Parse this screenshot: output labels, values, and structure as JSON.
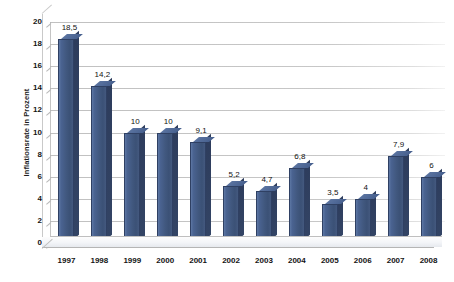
{
  "chart_data": {
    "type": "bar",
    "title": "",
    "xlabel": "",
    "ylabel": "Inflationsrate in Prozent",
    "categories": [
      "1997",
      "1998",
      "1999",
      "2000",
      "2001",
      "2002",
      "2003",
      "2004",
      "2005",
      "2006",
      "2007",
      "2008"
    ],
    "values": [
      18.5,
      14.2,
      10,
      10,
      9.1,
      5.2,
      4.7,
      6.8,
      3.5,
      4,
      7.9,
      6
    ],
    "value_labels": [
      "18,5",
      "14,2",
      "10",
      "10",
      "9,1",
      "5,2",
      "4,7",
      "6,8",
      "3,5",
      "4",
      "7,9",
      "6"
    ],
    "ylim": [
      0,
      20
    ],
    "ytick_values": [
      0,
      2,
      4,
      6,
      8,
      10,
      12,
      14,
      16,
      18,
      20
    ],
    "ytick_labels": [
      "0",
      "2",
      "4",
      "6",
      "8",
      "10",
      "12",
      "14",
      "16",
      "18",
      "20"
    ],
    "grid": true,
    "grid_axis": "y",
    "legend": false,
    "legend_position": "none",
    "style": "3d-column",
    "bar_color": "#44597f",
    "bar_side_color": "#2f4063",
    "grid_color": "#bdbdbd",
    "axis_color": "#c4c4c4",
    "background_color": "#ffffff",
    "text_color": "#141414",
    "decimal_separator": ","
  }
}
